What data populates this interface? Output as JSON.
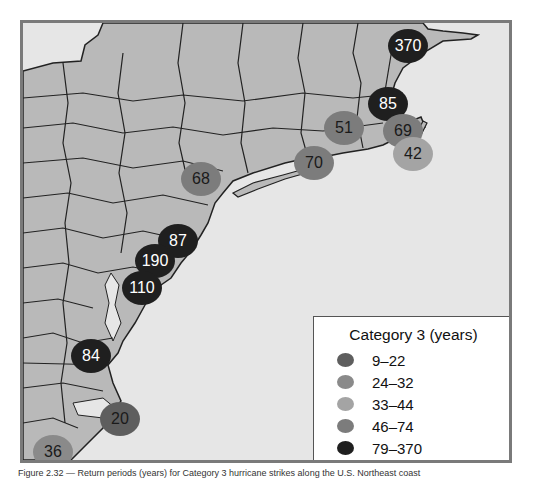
{
  "map": {
    "region": "U.S. Northeast / Mid-Atlantic coast",
    "water_color": "#e6e6e6",
    "land_color": "#b9b9b9",
    "border_color": "#222222"
  },
  "legend": {
    "title": "Category 3 (years)",
    "items": [
      {
        "label": "9–22",
        "color": "#5e5e5e"
      },
      {
        "label": "24–32",
        "color": "#8a8a8a"
      },
      {
        "label": "33–44",
        "color": "#a4a4a4"
      },
      {
        "label": "46–74",
        "color": "#7c7c7c"
      },
      {
        "label": "79–370",
        "color": "#1f1f1f"
      }
    ]
  },
  "markers": [
    {
      "value": "370",
      "x": 385,
      "y": 23,
      "category": "79–370"
    },
    {
      "value": "85",
      "x": 365,
      "y": 81,
      "category": "79–370"
    },
    {
      "value": "51",
      "x": 321,
      "y": 105,
      "category": "46–74"
    },
    {
      "value": "69",
      "x": 380,
      "y": 108,
      "category": "46–74"
    },
    {
      "value": "42",
      "x": 390,
      "y": 131,
      "category": "33–44"
    },
    {
      "value": "70",
      "x": 291,
      "y": 140,
      "category": "46–74"
    },
    {
      "value": "68",
      "x": 178,
      "y": 156,
      "category": "46–74"
    },
    {
      "value": "87",
      "x": 155,
      "y": 218,
      "category": "79–370"
    },
    {
      "value": "190",
      "x": 132,
      "y": 238,
      "category": "79–370"
    },
    {
      "value": "110",
      "x": 119,
      "y": 265,
      "category": "79–370"
    },
    {
      "value": "84",
      "x": 68,
      "y": 333,
      "category": "79–370"
    },
    {
      "value": "20",
      "x": 97,
      "y": 396,
      "category": "9–22"
    },
    {
      "value": "36",
      "x": 30,
      "y": 429,
      "category": "24–32"
    }
  ],
  "caption": "Figure 2.32 — Return periods (years) for Category 3 hurricane strikes along the U.S. Northeast coast"
}
